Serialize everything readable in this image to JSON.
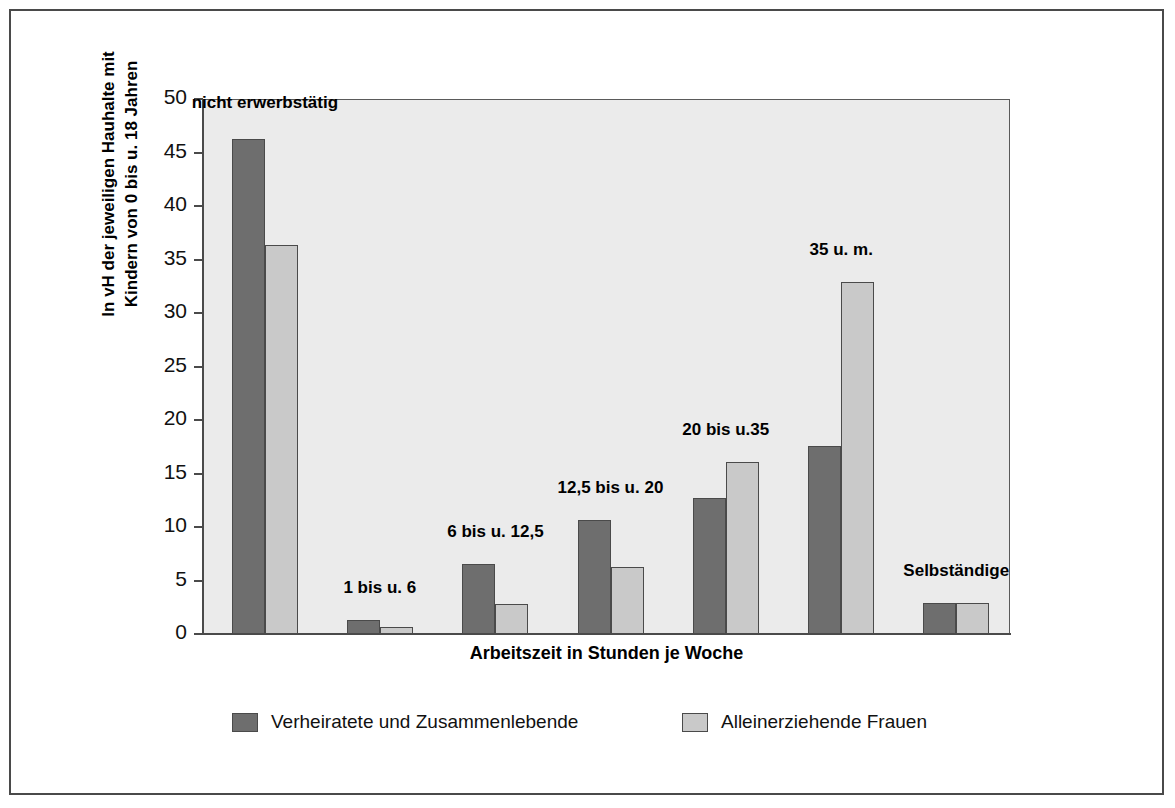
{
  "chart_data": {
    "type": "bar",
    "title": "",
    "subtitle": "",
    "xlabel": "Arbeitszeit in Stunden je Woche",
    "ylabel": "In vH der jeweiligen Haushalte mit Kindern von 0 bis u. 18 Jahren",
    "ylabel_line1": "In vH der jeweiligen Hauhalte mit",
    "ylabel_line2": "Kindern von 0 bis  u. 18 Jahren",
    "categories": [
      "nicht erwerbstätig",
      "1 bis u. 6",
      "6 bis u. 12,5",
      "12,5 bis u. 20",
      "20 bis u.35",
      "35 u. m.",
      "Selbständige"
    ],
    "series": [
      {
        "name": "Verheiratete und Zusammenlebende",
        "color": "#6e6e6e",
        "values": [
          46.3,
          1.3,
          6.5,
          10.7,
          12.7,
          17.6,
          2.9
        ]
      },
      {
        "name": "Alleinerziehende Frauen",
        "color": "#c9c9c9",
        "values": [
          36.4,
          0.7,
          2.8,
          6.3,
          16.1,
          32.9,
          2.9
        ]
      }
    ],
    "ylim": [
      0,
      50
    ],
    "ytick_step": 5,
    "ytick_labels": [
      "0",
      "5",
      "10",
      "15",
      "20",
      "25",
      "30",
      "35",
      "40",
      "45",
      "50"
    ],
    "grid": false,
    "legend_position": "bottom",
    "plot_background": "#ebebeb",
    "frame_color": "#4a4a4a"
  },
  "legend": {
    "entries": [
      {
        "label": "Verheiratete und Zusammenlebende"
      },
      {
        "label": "Alleinerziehende Frauen"
      }
    ]
  }
}
